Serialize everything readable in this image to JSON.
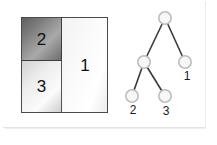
{
  "figure": {
    "background_color": "#ffffff",
    "card_border_color": "#e3e3e3"
  },
  "partition_diagram": {
    "name": "partitioned-rectangle",
    "outline_color": "#4a4a4a",
    "cells": [
      {
        "id": "cell-2",
        "label": "2",
        "shade": "dark",
        "position": "upper-left",
        "fill_start": "#5f5f5f",
        "fill_end": "#6e6e6e"
      },
      {
        "id": "cell-3",
        "label": "3",
        "shade": "light",
        "position": "lower-left",
        "fill_start": "#d2d2d2",
        "fill_end": "#cfcfcf"
      },
      {
        "id": "cell-1",
        "label": "1",
        "shade": "light",
        "position": "right",
        "fill_start": "#f2f2f2",
        "fill_end": "#ececec"
      }
    ]
  },
  "tree_diagram": {
    "name": "binary-partition-tree",
    "node_fill": "#f7f7f7",
    "node_stroke": "#b5b5b5",
    "edge_color": "#3a3a3a",
    "nodes": [
      {
        "id": "root",
        "label": "",
        "x": 52,
        "y": 12
      },
      {
        "id": "inner",
        "label": "",
        "x": 31,
        "y": 56
      },
      {
        "id": "leaf1",
        "label": "1",
        "x": 72,
        "y": 56
      },
      {
        "id": "leaf2",
        "label": "2",
        "x": 19,
        "y": 90
      },
      {
        "id": "leaf3",
        "label": "3",
        "x": 52,
        "y": 90
      }
    ],
    "edges": [
      {
        "from": "root",
        "to": "inner"
      },
      {
        "from": "root",
        "to": "leaf1"
      },
      {
        "from": "inner",
        "to": "leaf2"
      },
      {
        "from": "inner",
        "to": "leaf3"
      }
    ],
    "labels": [
      {
        "for": "leaf1",
        "text": "1"
      },
      {
        "for": "leaf2",
        "text": "2"
      },
      {
        "for": "leaf3",
        "text": "3"
      }
    ]
  }
}
